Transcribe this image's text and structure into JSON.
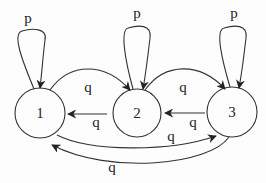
{
  "diagram": {
    "type": "state-transition-graph",
    "nodes": [
      {
        "id": "1",
        "label": "1"
      },
      {
        "id": "2",
        "label": "2"
      },
      {
        "id": "3",
        "label": "3"
      }
    ],
    "edges": [
      {
        "from": "1",
        "to": "1",
        "label": "p"
      },
      {
        "from": "2",
        "to": "2",
        "label": "p"
      },
      {
        "from": "3",
        "to": "3",
        "label": "p"
      },
      {
        "from": "1",
        "to": "2",
        "label": "q"
      },
      {
        "from": "2",
        "to": "3",
        "label": "q"
      },
      {
        "from": "2",
        "to": "1",
        "label": "q"
      },
      {
        "from": "3",
        "to": "2",
        "label": "q"
      },
      {
        "from": "1",
        "to": "3",
        "label": "q"
      },
      {
        "from": "3",
        "to": "1",
        "label": "q"
      }
    ],
    "colors": {
      "stroke": "#333333",
      "background": "#fdfdfd"
    }
  }
}
